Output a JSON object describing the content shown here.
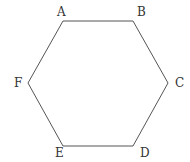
{
  "diagram": {
    "type": "hexagon",
    "stroke_color": "#555555",
    "vertices": [
      {
        "label": "A",
        "x": 63,
        "y": 21,
        "lx": 57,
        "ly": 16
      },
      {
        "label": "B",
        "x": 133,
        "y": 21,
        "lx": 137,
        "ly": 16
      },
      {
        "label": "C",
        "x": 168,
        "y": 83,
        "lx": 175,
        "ly": 87
      },
      {
        "label": "D",
        "x": 133,
        "y": 146,
        "lx": 140,
        "ly": 157
      },
      {
        "label": "E",
        "x": 63,
        "y": 146,
        "lx": 55,
        "ly": 157
      },
      {
        "label": "F",
        "x": 28,
        "y": 83,
        "lx": 14,
        "ly": 87
      }
    ]
  }
}
